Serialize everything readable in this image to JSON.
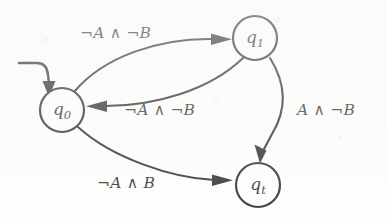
{
  "figure": {
    "kind": "state-transition-diagram",
    "background_color": "#fdfdfc",
    "stroke_color": "#101010"
  },
  "states": [
    {
      "id": "q0",
      "label_base": "q",
      "label_sub": "0",
      "cx": 62,
      "cy": 110,
      "r": 22,
      "is_initial": true
    },
    {
      "id": "q1",
      "label_base": "q",
      "label_sub": "1",
      "cx": 255,
      "cy": 38,
      "r": 22,
      "is_initial": false
    },
    {
      "id": "qt",
      "label_base": "q",
      "label_sub": "t",
      "cx": 258,
      "cy": 185,
      "r": 22,
      "is_initial": false
    }
  ],
  "transitions": [
    {
      "id": "t-q0-q1",
      "from": "q0",
      "to": "q1",
      "label": "¬A ∧ ¬B",
      "label_x": 80,
      "label_y": 26
    },
    {
      "id": "t-q1-q0",
      "from": "q1",
      "to": "q0",
      "label": "¬A ∧ ¬B",
      "label_x": 124,
      "label_y": 103
    },
    {
      "id": "t-q1-qt",
      "from": "q1",
      "to": "qt",
      "label": "A ∧ ¬B",
      "label_x": 297,
      "label_y": 103
    },
    {
      "id": "t-q0-qt",
      "from": "q0",
      "to": "qt",
      "label": "¬A ∧ B",
      "label_x": 97,
      "label_y": 176
    }
  ],
  "initial_marker": {
    "id": "start-arrow",
    "target": "q0",
    "description": "incoming start arrow into q0"
  }
}
